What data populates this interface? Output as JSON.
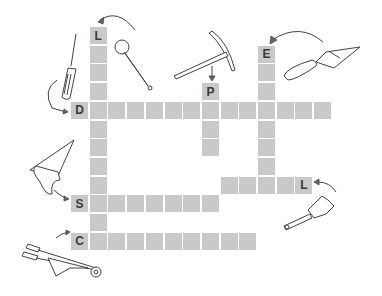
{
  "puzzle": {
    "type": "crossword",
    "theme": "tools",
    "cell_color": "#c9c9c9",
    "letter_color": "#3a3a3a",
    "words": [
      {
        "id": "L-down",
        "start_letter": "L",
        "direction": "down",
        "length": 12,
        "tool_hint": "adjustable-wrench"
      },
      {
        "id": "D-across",
        "start_letter": "D",
        "direction": "across",
        "length": 14,
        "tool_hint": "screwdriver"
      },
      {
        "id": "P-down",
        "start_letter": "P",
        "direction": "down",
        "length": 4,
        "tool_hint": "pickaxe"
      },
      {
        "id": "E-down",
        "start_letter": "E",
        "direction": "down",
        "length": 8,
        "tool_hint": "trowel"
      },
      {
        "id": "L-across-right",
        "start_letter": "L",
        "direction": "leftward",
        "length": 5,
        "tool_hint": "pipe-wrench"
      },
      {
        "id": "S-across",
        "start_letter": "S",
        "direction": "across",
        "length": 8,
        "tool_hint": "saw"
      },
      {
        "id": "C-across",
        "start_letter": "C",
        "direction": "across",
        "length": 10,
        "tool_hint": "wheelbarrow"
      }
    ]
  }
}
